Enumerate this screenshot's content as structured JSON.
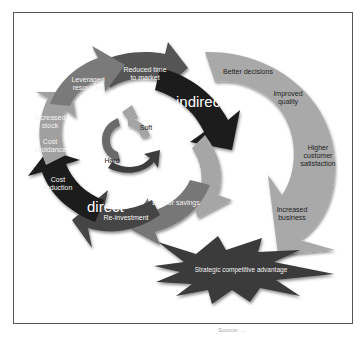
{
  "diagram": {
    "outer_cycle": {
      "segments": [
        {
          "label": "Reduced time\nto market"
        },
        {
          "label": "Leveraged\nresources"
        },
        {
          "label": "Increased\nstock"
        },
        {
          "label": "Cost\navoidance"
        },
        {
          "label": "Cost\nreduction"
        },
        {
          "label": "Re-investment"
        },
        {
          "label": "Labour savings"
        }
      ],
      "indirect_label": "indirect",
      "direct_label": "direct"
    },
    "inner_cycle": {
      "soft_label": "Soft",
      "hard_label": "Hard"
    },
    "outcome_arc": {
      "items": [
        {
          "label": "Better decisions"
        },
        {
          "label": "Improved\nquality"
        },
        {
          "label": "Higher\ncustomer\nsatisfaction"
        },
        {
          "label": "Increased\nbusiness"
        }
      ]
    },
    "starburst": {
      "label": "Strategic competitive advantage"
    },
    "caption": "Source: ..."
  },
  "colors": {
    "dark": "#1c1c1c",
    "dark_grey": "#444444",
    "mid_grey": "#6e6e6e",
    "light_grey": "#9a9a9a",
    "pale_grey": "#b6b6b6",
    "arc_grey": "#a8a8a8",
    "burst": "#3a3a3a"
  }
}
